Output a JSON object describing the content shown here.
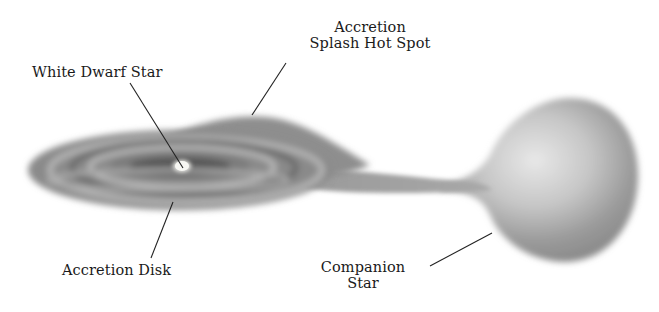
{
  "diagram": {
    "labels": {
      "white_dwarf": "White Dwarf Star",
      "hot_spot_line1": "Accretion",
      "hot_spot_line2": "Splash Hot Spot",
      "accretion_disk": "Accretion Disk",
      "companion_line1": "Companion",
      "companion_line2": "Star"
    },
    "colors": {
      "background": "#ffffff",
      "disk_dark": "#6e6e6e",
      "disk_light": "#b8b8b8",
      "star_light": "#e4e4e4",
      "star_dark": "#8a8a8a",
      "white_dwarf": "#f4f4f0",
      "leader_line": "#222222",
      "text": "#1a1a1a"
    }
  }
}
